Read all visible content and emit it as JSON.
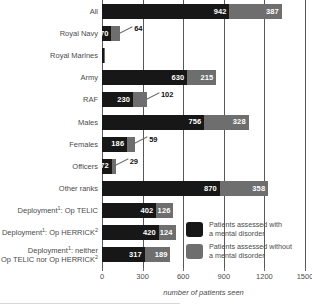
{
  "chart_data": {
    "type": "bar",
    "orientation": "horizontal",
    "stacked": true,
    "title": "",
    "xlabel": "number of patients seen",
    "ylabel": "",
    "xlim": [
      0,
      1500
    ],
    "xticks": [
      0,
      300,
      600,
      900,
      1200,
      1500
    ],
    "xtick_labels": [
      "0",
      "300",
      "600",
      "900",
      "1200",
      "1500"
    ],
    "grid": true,
    "grid_axis": "x",
    "legend_position": "inside-lower-right",
    "categories": [
      "All",
      "Royal Navy",
      "Royal Marines",
      "Army",
      "RAF",
      "Males",
      "Females",
      "Officers",
      "Other ranks",
      "Deployment1 : Op TELIC",
      "Deployment1 : Op HERRICK2",
      "Deployment1 : neither Op TELIC nor Op HERRICK2"
    ],
    "series": [
      {
        "name": "Patients assessed with a mental disorder",
        "color": "#171717",
        "values": [
          942,
          70,
          12,
          630,
          230,
          756,
          186,
          72,
          870,
          402,
          420,
          317
        ]
      },
      {
        "name": "Patients assessed without a mental disorder",
        "color": "#6e6e6e",
        "values": [
          387,
          64,
          5,
          215,
          102,
          328,
          59,
          29,
          358,
          126,
          124,
          189
        ]
      }
    ]
  },
  "axis": {
    "x_title": "number of patients seen",
    "ticks": [
      {
        "value": 0,
        "label": "0"
      },
      {
        "value": 300,
        "label": "300"
      },
      {
        "value": 600,
        "label": "600"
      },
      {
        "value": 900,
        "label": "900"
      },
      {
        "value": 1200,
        "label": "1200"
      },
      {
        "value": 1500,
        "label": "1500"
      }
    ]
  },
  "rows": [
    {
      "key": "all",
      "label_line1": "All",
      "label_line2": "",
      "sup1": "",
      "sup2": "",
      "dark": 942,
      "grey": 387,
      "dark_label": "942",
      "grey_label": "387",
      "callout": false
    },
    {
      "key": "royal-navy",
      "label_line1": "Royal Navy",
      "label_line2": "",
      "sup1": "",
      "sup2": "",
      "dark": 70,
      "grey": 64,
      "dark_label": "70",
      "grey_label": "64",
      "callout": true
    },
    {
      "key": "royal-marines",
      "label_line1": "Royal Marines",
      "label_line2": "",
      "sup1": "",
      "sup2": "",
      "dark": 12,
      "grey": 5,
      "dark_label": "",
      "grey_label": "",
      "callout": false
    },
    {
      "key": "army",
      "label_line1": "Army",
      "label_line2": "",
      "sup1": "",
      "sup2": "",
      "dark": 630,
      "grey": 215,
      "dark_label": "630",
      "grey_label": "215",
      "callout": false
    },
    {
      "key": "raf",
      "label_line1": "RAF",
      "label_line2": "",
      "sup1": "",
      "sup2": "",
      "dark": 230,
      "grey": 102,
      "dark_label": "230",
      "grey_label": "102",
      "callout": true
    },
    {
      "key": "males",
      "label_line1": "Males",
      "label_line2": "",
      "sup1": "",
      "sup2": "",
      "dark": 756,
      "grey": 328,
      "dark_label": "756",
      "grey_label": "328",
      "callout": false
    },
    {
      "key": "females",
      "label_line1": "Females",
      "label_line2": "",
      "sup1": "",
      "sup2": "",
      "dark": 186,
      "grey": 59,
      "dark_label": "186",
      "grey_label": "59",
      "callout": true
    },
    {
      "key": "officers",
      "label_line1": "Officers",
      "label_line2": "",
      "sup1": "",
      "sup2": "",
      "dark": 72,
      "grey": 29,
      "dark_label": "72",
      "grey_label": "29",
      "callout": true
    },
    {
      "key": "other-ranks",
      "label_line1": "Other ranks",
      "label_line2": "",
      "sup1": "",
      "sup2": "",
      "dark": 870,
      "grey": 358,
      "dark_label": "870",
      "grey_label": "358",
      "callout": false
    },
    {
      "key": "deployment-op-telic",
      "label_line1": "Deployment",
      "label_line1b": ": Op TELIC",
      "label_line2": "",
      "sup1": "1",
      "sup2": "",
      "dark": 402,
      "grey": 126,
      "dark_label": "402",
      "grey_label": "126",
      "callout": false
    },
    {
      "key": "deployment-op-herrick",
      "label_line1": "Deployment",
      "label_line1b": ": Op HERRICK",
      "label_line2": "",
      "sup1": "1",
      "sup2": "2",
      "dark": 420,
      "grey": 124,
      "dark_label": "420",
      "grey_label": "124",
      "callout": false
    },
    {
      "key": "deployment-neither",
      "label_line1": "Deployment",
      "label_line1b": ": neither",
      "label_line2": "Op TELIC nor Op HERRICK",
      "sup1": "1",
      "sup2": "2",
      "dark": 317,
      "grey": 189,
      "dark_label": "317",
      "grey_label": "189",
      "callout": false
    }
  ],
  "legend": {
    "items": [
      {
        "key": "with-disorder",
        "color": "#171717",
        "line1": "Patients assessed with",
        "line2": "a mental disorder"
      },
      {
        "key": "without-disorder",
        "color": "#6e6e6e",
        "line1": "Patients assessed without",
        "line2": "a mental disorder"
      }
    ]
  }
}
